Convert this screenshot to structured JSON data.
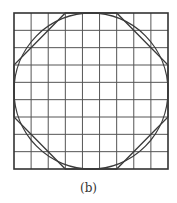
{
  "figure": {
    "caption": "(b)",
    "grid": {
      "rows": 9,
      "cols": 9,
      "x0": 14,
      "y0": 13,
      "x1": 168,
      "y1": 169,
      "line_color": "#555555",
      "border_color": "#333333"
    },
    "circle": {
      "cx": 91,
      "cy": 91,
      "rx": 77,
      "ry": 78,
      "stroke": "#3a3a3a"
    },
    "octagon": {
      "corner_cut_cells": 3,
      "stroke": "#3a3a3a"
    },
    "colors": {
      "background": "#ffffff",
      "ink": "#333333"
    }
  }
}
